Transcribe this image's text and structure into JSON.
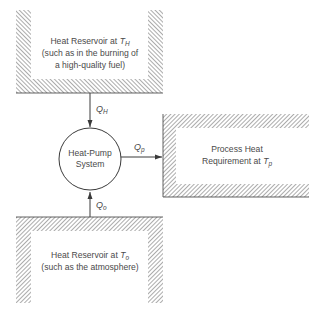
{
  "diagram": {
    "hot_reservoir": {
      "lines": [
        "Heat Reservoir at ",
        "(such as in the burning of",
        "a high-quality fuel)"
      ],
      "temp_symbol": "T",
      "temp_subscript": "H"
    },
    "heat_pump": {
      "lines": [
        "Heat-Pump",
        "System"
      ]
    },
    "process": {
      "lines": [
        "Process Heat",
        "Requirement at "
      ],
      "temp_symbol": "T",
      "temp_subscript": "p"
    },
    "cold_reservoir": {
      "lines": [
        "Heat Reservoir at ",
        "(such as the atmosphere)"
      ],
      "temp_symbol": "T",
      "temp_subscript": "o"
    },
    "flows": {
      "q_h": {
        "symbol": "Q",
        "subscript": "H"
      },
      "q_p": {
        "symbol": "Q",
        "subscript": "p"
      },
      "q_o": {
        "symbol": "Q",
        "subscript": "o"
      }
    },
    "colors": {
      "line": "#3a3a3a",
      "hatch": "#5a5a5a",
      "text": "#4a4a4a"
    }
  }
}
